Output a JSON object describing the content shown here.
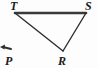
{
  "figure": {
    "kind": "geometry-diagram",
    "width": 98,
    "height": 68,
    "background_color": "#fdfdfd",
    "stroke_color": "#333333",
    "label_color": "#1a1a1a",
    "labels": {
      "T": "T",
      "S": "S",
      "R": "R",
      "P": "P"
    },
    "points": {
      "T": {
        "x": 15,
        "y": 13
      },
      "S": {
        "x": 86,
        "y": 13
      },
      "R": {
        "x": 63,
        "y": 51
      },
      "P": {
        "x": 8,
        "y": 58
      }
    },
    "segments": [
      {
        "name": "TS",
        "from": "T",
        "to": "S",
        "width": 2.6
      },
      {
        "name": "TR",
        "from": "T",
        "to": "R",
        "width": 1.4
      },
      {
        "name": "SR",
        "from": "S",
        "to": "R",
        "width": 1.4
      }
    ],
    "ray": {
      "name": "ray-at-P",
      "from_x": 11,
      "from_y": 49,
      "to_x": 1,
      "to_y": 47,
      "width": 2.0
    }
  }
}
